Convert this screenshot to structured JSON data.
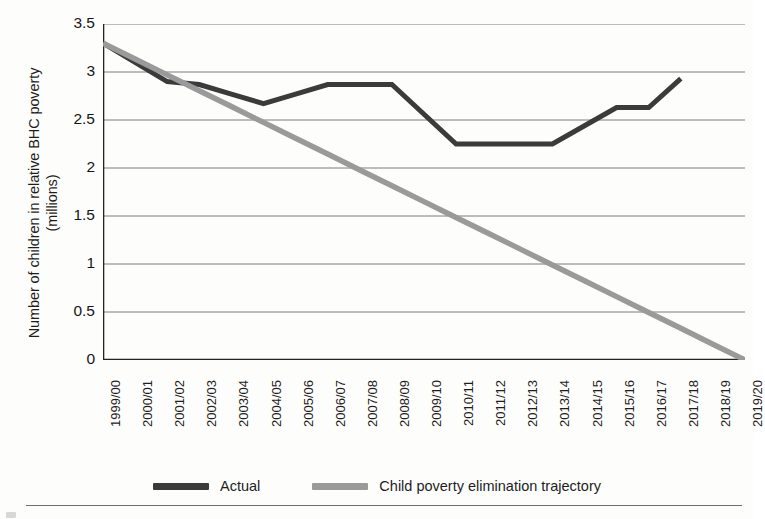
{
  "chart_data": {
    "type": "line",
    "title": "",
    "xlabel": "",
    "ylabel": "Number of children in relative BHC poverty\n(millions)",
    "categories": [
      "1999/00",
      "2000/01",
      "2001/02",
      "2002/03",
      "2003/04",
      "2004/05",
      "2005/06",
      "2006/07",
      "2007/08",
      "2008/09",
      "2009/10",
      "2010/11",
      "2011/12",
      "2012/13",
      "2013/14",
      "2014/15",
      "2015/16",
      "2016/17",
      "2017/18",
      "2018/19",
      "2019/20"
    ],
    "ylim": [
      0,
      3.5
    ],
    "yticks": [
      0,
      0.5,
      1,
      1.5,
      2,
      2.5,
      3,
      3.5
    ],
    "ytick_labels": [
      "0",
      "0.5",
      "1",
      "1.5",
      "2",
      "2.5",
      "3",
      "3.5"
    ],
    "grid": true,
    "legend_position": "bottom",
    "series": [
      {
        "name": "Actual",
        "color": "#3b3b3b",
        "values": [
          3.3,
          3.1,
          2.9,
          2.87,
          2.77,
          2.67,
          2.77,
          2.87,
          2.87,
          2.87,
          2.56,
          2.25,
          2.25,
          2.25,
          2.25,
          2.44,
          2.63,
          2.63,
          2.93,
          null,
          null
        ]
      },
      {
        "name": "Child poverty elimination trajectory",
        "color": "#9a9a9a",
        "values": [
          3.3,
          3.135,
          2.97,
          2.805,
          2.64,
          2.475,
          2.31,
          2.145,
          1.98,
          1.815,
          1.65,
          1.485,
          1.32,
          1.155,
          0.99,
          0.825,
          0.66,
          0.495,
          0.33,
          0.165,
          0.0
        ]
      }
    ]
  },
  "legend": {
    "items": [
      {
        "label": "Actual",
        "color": "#3b3b3b"
      },
      {
        "label": "Child poverty elimination trajectory",
        "color": "#9a9a9a"
      }
    ]
  }
}
